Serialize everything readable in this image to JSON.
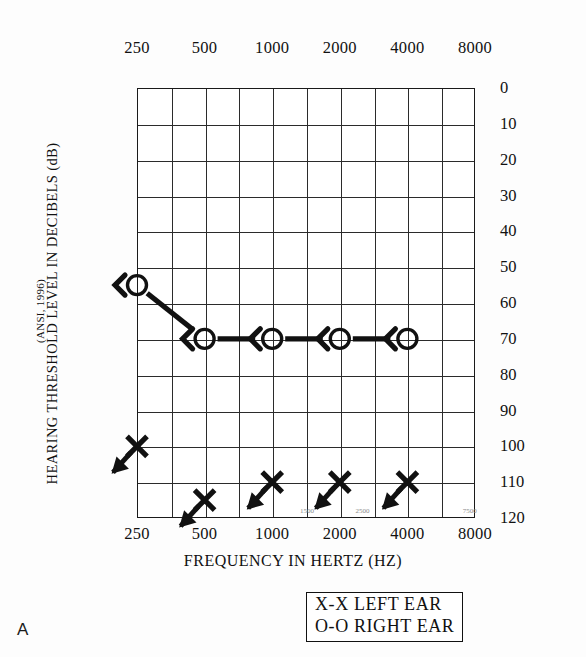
{
  "panel_letter": "A",
  "axes": {
    "x_title": "FREQUENCY IN HERTZ (HZ)",
    "y_title": "HEARING THRESHOLD LEVEL IN DECIBELS (dB)",
    "y_subtitle": "(ANSI, 1996)",
    "x_tick_labels": [
      "250",
      "500",
      "1000",
      "2000",
      "4000",
      "8000"
    ],
    "x_minor_labels": [
      "1500",
      "2500",
      "7500"
    ],
    "y_tick_labels": [
      "0",
      "10",
      "20",
      "30",
      "40",
      "50",
      "60",
      "70",
      "80",
      "90",
      "100",
      "110",
      "120"
    ]
  },
  "legend": {
    "left_ear": "X-X LEFT EAR",
    "right_ear": "O-O RIGHT EAR"
  },
  "colors": {
    "ink": "#111111",
    "grid": "#2b2b2b",
    "background": "#ffffff"
  },
  "chart_data": {
    "type": "line",
    "title": "",
    "subtitle": "",
    "xlabel": "FREQUENCY IN HERTZ (HZ)",
    "ylabel": "HEARING THRESHOLD LEVEL IN DECIBELS (dB)",
    "y_axis_note": "(ANSI, 1996)",
    "x_scale": "log2",
    "x": [
      250,
      500,
      1000,
      2000,
      4000,
      8000
    ],
    "xlim": [
      250,
      8000
    ],
    "ylim": [
      0,
      120
    ],
    "y_inverted": true,
    "y_ticks": [
      0,
      10,
      20,
      30,
      40,
      50,
      60,
      70,
      80,
      90,
      100,
      110,
      120
    ],
    "grid": true,
    "grid_vertical_frequencies": [
      250,
      375,
      500,
      750,
      1000,
      1500,
      2000,
      3000,
      4000,
      6000,
      8000
    ],
    "legend_position": "below-right",
    "series": [
      {
        "name": "O-O RIGHT EAR",
        "marker": "circle",
        "masked_marker": "left-bracket",
        "connected": true,
        "points": [
          {
            "x": 250,
            "y": 55,
            "masked": true,
            "no_response": false
          },
          {
            "x": 500,
            "y": 70,
            "masked": true,
            "no_response": false
          },
          {
            "x": 1000,
            "y": 70,
            "masked": true,
            "no_response": false
          },
          {
            "x": 2000,
            "y": 70,
            "masked": true,
            "no_response": false
          },
          {
            "x": 4000,
            "y": 70,
            "masked": true,
            "no_response": false
          }
        ]
      },
      {
        "name": "X-X LEFT EAR",
        "marker": "cross",
        "connected": false,
        "points": [
          {
            "x": 250,
            "y": 100,
            "no_response": true
          },
          {
            "x": 500,
            "y": 115,
            "no_response": true
          },
          {
            "x": 1000,
            "y": 110,
            "no_response": true
          },
          {
            "x": 2000,
            "y": 110,
            "no_response": true
          },
          {
            "x": 4000,
            "y": 110,
            "no_response": true
          }
        ]
      }
    ]
  }
}
